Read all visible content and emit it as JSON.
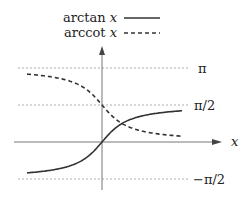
{
  "chart_data": {
    "type": "line",
    "title": "",
    "xlabel": "x",
    "ylabel": "",
    "grid": "horizontal dashed reference lines",
    "legend_position": "top",
    "legend": [
      {
        "name": "arctan x",
        "func": "arctan",
        "style": "solid"
      },
      {
        "name": "arccot x",
        "func": "arccot",
        "style": "dashed"
      }
    ],
    "y_reference_lines": [
      {
        "label": "π",
        "value": 3.14159
      },
      {
        "label": "π/2",
        "value": 1.5708
      },
      {
        "label": "−π/2",
        "value": -1.5708
      }
    ],
    "xlim": [
      -4,
      4
    ],
    "ylim": [
      -1.5708,
      3.14159
    ],
    "series": [
      {
        "name": "arctan x",
        "x": [
          -4,
          -3,
          -2,
          -1,
          0,
          1,
          2,
          3,
          4
        ],
        "values": [
          -1.33,
          -1.25,
          -1.11,
          -0.79,
          0,
          0.79,
          1.11,
          1.25,
          1.33
        ]
      },
      {
        "name": "arccot x",
        "x": [
          -4,
          -3,
          -2,
          -1,
          0,
          1,
          2,
          3,
          4
        ],
        "values": [
          2.9,
          2.82,
          2.68,
          2.36,
          1.57,
          0.79,
          0.46,
          0.32,
          0.24
        ]
      }
    ]
  },
  "legend": {
    "arctan_label": "arctan",
    "arccot_label": "arccot",
    "var": "x"
  },
  "axes": {
    "x_label": "x",
    "tick_pi": "π",
    "tick_half_pi": "π/2",
    "tick_neg_half_pi": "−π/2"
  }
}
